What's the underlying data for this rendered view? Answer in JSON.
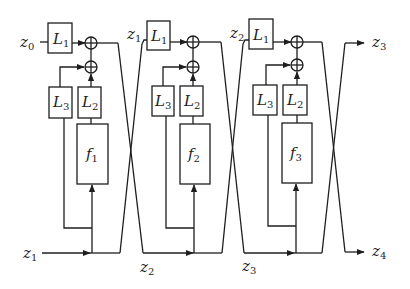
{
  "diagram": {
    "type": "reversible coupling network (3 stages)",
    "colors": {
      "stroke": "#1e1e1e",
      "background": "#ffffff"
    },
    "inputs": [
      {
        "id": "z0",
        "base": "z",
        "sub": "0"
      },
      {
        "id": "z1_in",
        "base": "z",
        "sub": "1"
      }
    ],
    "outputs": [
      {
        "id": "z3",
        "base": "z",
        "sub": "3"
      },
      {
        "id": "z4",
        "base": "z",
        "sub": "4"
      }
    ],
    "intermediate_labels": [
      {
        "id": "z1_top",
        "base": "z",
        "sub": "1"
      },
      {
        "id": "z2_top",
        "base": "z",
        "sub": "2"
      },
      {
        "id": "z2_bottom",
        "base": "z",
        "sub": "2"
      },
      {
        "id": "z3_bottom",
        "base": "z",
        "sub": "3"
      }
    ],
    "stages": [
      {
        "L1": {
          "base": "L",
          "sub": "1"
        },
        "L2": {
          "base": "L",
          "sub": "2"
        },
        "L3": {
          "base": "L",
          "sub": "3"
        },
        "f": {
          "base": "f",
          "sub": "1"
        }
      },
      {
        "L1": {
          "base": "L",
          "sub": "1"
        },
        "L2": {
          "base": "L",
          "sub": "2"
        },
        "L3": {
          "base": "L",
          "sub": "3"
        },
        "f": {
          "base": "f",
          "sub": "2"
        }
      },
      {
        "L1": {
          "base": "L",
          "sub": "1"
        },
        "L2": {
          "base": "L",
          "sub": "2"
        },
        "L3": {
          "base": "L",
          "sub": "3"
        },
        "f": {
          "base": "f",
          "sub": "3"
        }
      }
    ],
    "operators": {
      "add_symbol": "⊕"
    }
  }
}
